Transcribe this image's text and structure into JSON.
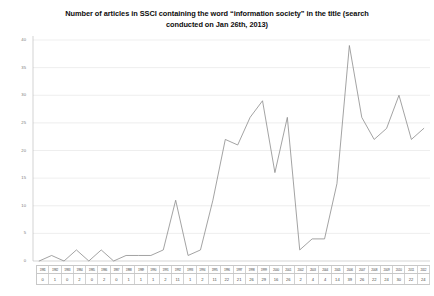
{
  "chart_data": {
    "type": "line",
    "title_lines": [
      "Number of articles in SSCI containing the word “information society” in the title (search",
      "conducted on Jan 26th, 2013)"
    ],
    "xlabel": "",
    "ylabel": "",
    "ylim": [
      0,
      40
    ],
    "yticks": [
      0,
      5,
      10,
      15,
      20,
      25,
      30,
      35,
      40
    ],
    "ytick_labels": [
      "0",
      "5",
      "10",
      "15",
      "20",
      "25",
      "30",
      "35",
      "40"
    ],
    "grid": true,
    "legend": false,
    "series_color": "#8c8c8c",
    "categories": [
      "1981",
      "1982",
      "1983",
      "1984",
      "1985",
      "1986",
      "1987",
      "1988",
      "1989",
      "1990",
      "1991",
      "1992",
      "1993",
      "1994",
      "1995",
      "1996",
      "1997",
      "1998",
      "1999",
      "2000",
      "2001",
      "2002",
      "2003",
      "2004",
      "2005",
      "2006",
      "2007",
      "2008",
      "2009",
      "2010",
      "2011",
      "2012"
    ],
    "values": [
      0,
      1,
      0,
      2,
      0,
      2,
      0,
      1,
      1,
      1,
      2,
      11,
      1,
      2,
      11,
      22,
      21,
      26,
      29,
      16,
      26,
      2,
      4,
      4,
      14,
      39,
      26,
      22,
      24,
      30,
      22,
      24
    ],
    "value_labels": [
      "0",
      "1",
      "0",
      "2",
      "0",
      "2",
      "0",
      "1",
      "1",
      "1",
      "2",
      "11",
      "1",
      "2",
      "11",
      "22",
      "21",
      "26",
      "29",
      "16",
      "26",
      "2",
      "4",
      "4",
      "14",
      "39",
      "26",
      "22",
      "24",
      "30",
      "22",
      "24"
    ]
  }
}
